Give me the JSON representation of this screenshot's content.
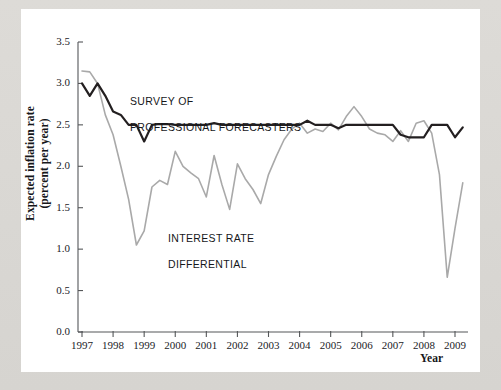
{
  "figure": {
    "background_color": "#ffffff",
    "page_color": "#d9d9d6"
  },
  "chart_data": {
    "type": "line",
    "title": "",
    "xlabel": "Year",
    "ylabel": "Expected inflation rate\n(percent per year)",
    "ylabel_line1": "Expected inflation rate",
    "ylabel_line2": "(percent per year)",
    "xlim": [
      1997,
      2009.5
    ],
    "ylim": [
      0.0,
      3.5
    ],
    "grid": false,
    "legend_position": "inline-annotations",
    "ytick_labels": [
      "0.0",
      "0.5",
      "1.0",
      "1.5",
      "2.0",
      "2.5",
      "3.0",
      "3.5"
    ],
    "ytick_values": [
      0.0,
      0.5,
      1.0,
      1.5,
      2.0,
      2.5,
      3.0,
      3.5
    ],
    "xtick_labels": [
      "1997",
      "1998",
      "1999",
      "2000",
      "2001",
      "2002",
      "2003",
      "2004",
      "2005",
      "2006",
      "2007",
      "2008",
      "2009"
    ],
    "xtick_values": [
      1997,
      1998,
      1999,
      2000,
      2001,
      2002,
      2003,
      2004,
      2005,
      2006,
      2007,
      2008,
      2009
    ],
    "series": [
      {
        "name": "SURVEY OF\nPROFESSIONAL FORECASTERS",
        "label_line1": "SURVEY OF",
        "label_line2": "PROFESSIONAL FORECASTERS",
        "color": "#231f20",
        "width": 2.2,
        "x": [
          1997.0,
          1997.25,
          1997.5,
          1997.75,
          1998.0,
          1998.25,
          1998.5,
          1998.75,
          1999.0,
          1999.25,
          1999.5,
          1999.75,
          2000.0,
          2000.25,
          2000.5,
          2000.75,
          2001.0,
          2001.25,
          2001.5,
          2001.75,
          2002.0,
          2002.25,
          2002.5,
          2002.75,
          2003.0,
          2003.25,
          2003.5,
          2003.75,
          2004.0,
          2004.25,
          2004.5,
          2004.75,
          2005.0,
          2005.25,
          2005.5,
          2005.75,
          2006.0,
          2006.25,
          2006.5,
          2006.75,
          2007.0,
          2007.25,
          2007.5,
          2007.75,
          2008.0,
          2008.25,
          2008.5,
          2008.75,
          2009.0,
          2009.25
        ],
        "y": [
          3.0,
          2.85,
          3.0,
          2.85,
          2.66,
          2.62,
          2.5,
          2.5,
          2.3,
          2.5,
          2.51,
          2.51,
          2.5,
          2.5,
          2.5,
          2.5,
          2.5,
          2.52,
          2.5,
          2.5,
          2.5,
          2.5,
          2.5,
          2.5,
          2.5,
          2.5,
          2.5,
          2.5,
          2.5,
          2.55,
          2.5,
          2.5,
          2.5,
          2.46,
          2.5,
          2.5,
          2.5,
          2.5,
          2.5,
          2.5,
          2.5,
          2.38,
          2.35,
          2.35,
          2.35,
          2.5,
          2.5,
          2.5,
          2.35,
          2.47
        ]
      },
      {
        "name": "INTEREST RATE\nDIFFERENTIAL",
        "label_line1": "INTEREST RATE",
        "label_line2": "DIFFERENTIAL",
        "color": "#a9a9a9",
        "width": 1.6,
        "x": [
          1997.0,
          1997.25,
          1997.5,
          1997.75,
          1998.0,
          1998.25,
          1998.5,
          1998.75,
          1999.0,
          1999.25,
          1999.5,
          1999.75,
          2000.0,
          2000.25,
          2000.5,
          2000.75,
          2001.0,
          2001.25,
          2001.5,
          2001.75,
          2002.0,
          2002.25,
          2002.5,
          2002.75,
          2003.0,
          2003.25,
          2003.5,
          2003.75,
          2004.0,
          2004.25,
          2004.5,
          2004.75,
          2005.0,
          2005.25,
          2005.5,
          2005.75,
          2006.0,
          2006.25,
          2006.5,
          2006.75,
          2007.0,
          2007.25,
          2007.5,
          2007.75,
          2008.0,
          2008.25,
          2008.5,
          2008.75,
          2009.0,
          2009.25
        ],
        "y": [
          3.15,
          3.14,
          3.0,
          2.62,
          2.38,
          2.0,
          1.6,
          1.05,
          1.22,
          1.75,
          1.83,
          1.78,
          2.18,
          2.0,
          1.92,
          1.85,
          1.63,
          2.13,
          1.78,
          1.48,
          2.03,
          1.85,
          1.72,
          1.55,
          1.9,
          2.12,
          2.32,
          2.45,
          2.52,
          2.4,
          2.45,
          2.42,
          2.52,
          2.44,
          2.6,
          2.72,
          2.6,
          2.45,
          2.4,
          2.38,
          2.3,
          2.43,
          2.3,
          2.52,
          2.55,
          2.4,
          1.9,
          0.66,
          1.25,
          1.8
        ]
      }
    ]
  }
}
